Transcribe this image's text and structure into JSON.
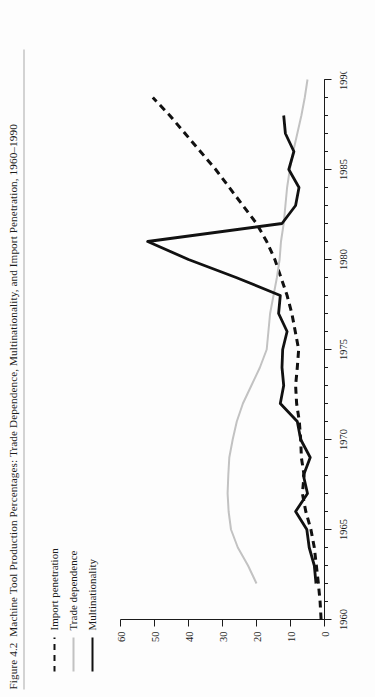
{
  "figure": {
    "number": "Figure 4.2",
    "caption": "Machine Tool Production Percentages: Trade Dependence, Multinationality, and Import Penetration, 1960–1990"
  },
  "legend": {
    "position": "upper-left",
    "items": [
      {
        "label": "Import penetration",
        "style": "dashed",
        "color": "#111111"
      },
      {
        "label": "Trade dependence",
        "style": "solid",
        "color": "#c2c2c2"
      },
      {
        "label": "Multinationality",
        "style": "solid",
        "color": "#111111"
      }
    ]
  },
  "chart_data": {
    "type": "line",
    "title": "Machine Tool Production Percentages: Trade Dependence, Multinationality, and Import Penetration, 1960–1990",
    "xlabel": "",
    "ylabel": "",
    "xlim": [
      1960,
      1990
    ],
    "ylim": [
      0,
      60
    ],
    "xticks": [
      1960,
      1965,
      1970,
      1975,
      1980,
      1985,
      1990
    ],
    "xticklabels": [
      "1960",
      "1965",
      "1970",
      "1975",
      "1980",
      "1985",
      "1990"
    ],
    "x_minor_tick_step": 1,
    "yticks": [
      0,
      10,
      20,
      30,
      40,
      50,
      60
    ],
    "yticklabels": [
      "0",
      "10",
      "20",
      "30",
      "40",
      "50",
      "60"
    ],
    "grid": false,
    "orientation": "rotated-90-clockwise",
    "x": [
      1960,
      1961,
      1962,
      1963,
      1964,
      1965,
      1966,
      1967,
      1968,
      1969,
      1970,
      1971,
      1972,
      1973,
      1974,
      1975,
      1976,
      1977,
      1978,
      1979,
      1980,
      1981,
      1982,
      1983,
      1984,
      1985,
      1986,
      1987,
      1988,
      1989,
      1990
    ],
    "series": [
      {
        "name": "Import penetration",
        "style": "dashed",
        "color": "#111111",
        "values": [
          1.0,
          1.3,
          1.8,
          2.4,
          3.0,
          4.0,
          5.5,
          6.5,
          6.0,
          6.8,
          7.0,
          7.4,
          8.2,
          8.5,
          8.0,
          7.6,
          8.6,
          9.6,
          11.0,
          12.8,
          14.6,
          17.0,
          20.0,
          24.0,
          28.0,
          32.0,
          36.5,
          41.0,
          45.5,
          50.5,
          null
        ]
      },
      {
        "name": "Trade dependence",
        "style": "solid",
        "color": "#c2c2c2",
        "values": [
          null,
          null,
          20.0,
          22.5,
          25.5,
          27.5,
          28.2,
          28.5,
          28.3,
          28.0,
          27.0,
          25.8,
          24.0,
          21.5,
          19.0,
          17.0,
          16.5,
          16.0,
          15.0,
          14.0,
          13.2,
          12.8,
          12.0,
          11.5,
          11.0,
          10.2,
          9.2,
          8.0,
          6.8,
          5.8,
          5.0
        ]
      },
      {
        "name": "Multinationality",
        "style": "solid",
        "color": "#111111",
        "values": [
          null,
          null,
          2.5,
          3.0,
          4.5,
          5.2,
          8.5,
          5.0,
          6.2,
          4.2,
          7.0,
          8.0,
          13.0,
          12.0,
          12.5,
          12.3,
          11.0,
          13.5,
          13.0,
          26.0,
          40.0,
          52.0,
          12.5,
          8.5,
          7.5,
          10.5,
          9.0,
          11.5,
          12.0,
          null,
          null
        ]
      }
    ]
  }
}
